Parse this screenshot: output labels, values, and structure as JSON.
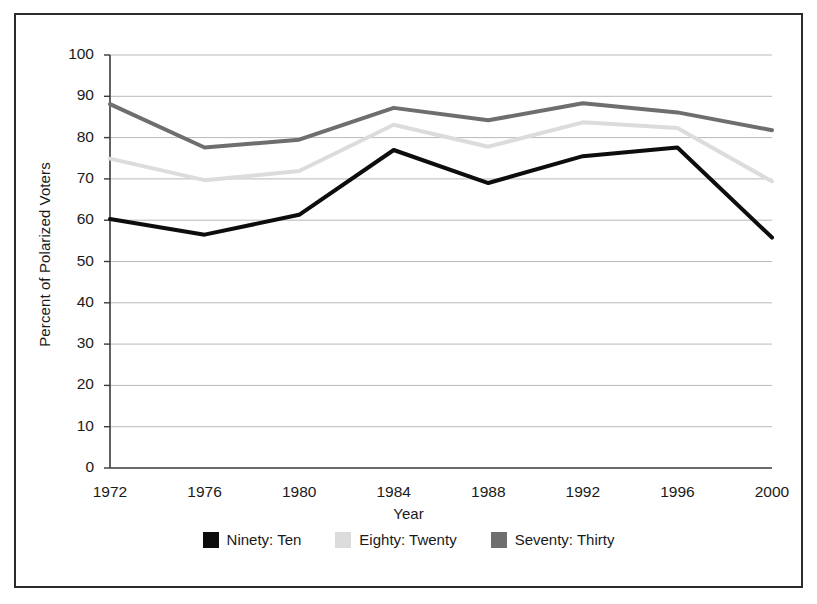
{
  "chart_data": {
    "type": "line",
    "title": "",
    "xlabel": "Year",
    "ylabel": "Percent of Polarized Voters",
    "categories": [
      "1972",
      "1976",
      "1980",
      "1984",
      "1988",
      "1992",
      "1996",
      "2000"
    ],
    "x": [
      1972,
      1976,
      1980,
      1984,
      1988,
      1992,
      1996,
      2000
    ],
    "ylim": [
      0,
      100
    ],
    "y_ticks": [
      "0",
      "10",
      "20",
      "30",
      "40",
      "50",
      "60",
      "70",
      "80",
      "90",
      "100"
    ],
    "grid": true,
    "legend_position": "bottom",
    "series": [
      {
        "name": "Ninety: Ten",
        "color": "#0d0d0d",
        "values": [
          60.3,
          56.5,
          61.3,
          77.0,
          69.0,
          75.5,
          77.6,
          55.8
        ]
      },
      {
        "name": "Eighty: Twenty",
        "color": "#dcdcdc",
        "values": [
          74.9,
          69.7,
          71.9,
          83.1,
          77.8,
          83.7,
          82.3,
          69.4
        ]
      },
      {
        "name": "Seventy: Thirty",
        "color": "#6e6e6e",
        "values": [
          88.1,
          77.6,
          79.5,
          87.2,
          84.2,
          88.3,
          86.1,
          81.8
        ]
      }
    ]
  },
  "legend": {
    "entries": [
      {
        "label": "Ninety: Ten",
        "color": "#0d0d0d"
      },
      {
        "label": "Eighty: Twenty",
        "color": "#dcdcdc"
      },
      {
        "label": "Seventy: Thirty",
        "color": "#6e6e6e"
      }
    ]
  },
  "axes": {
    "x_title": "Year",
    "y_title": "Percent of Polarized Voters"
  }
}
